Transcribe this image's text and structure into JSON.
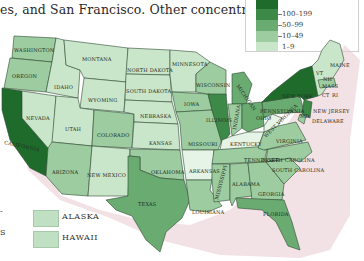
{
  "caption": "es, and San Francisco. Other concentrated",
  "legend": {
    "items": [
      {
        "label": "100–199",
        "color": "#3d8a48"
      },
      {
        "label": "50–99",
        "color": "#6aab72"
      },
      {
        "label": "10–49",
        "color": "#9ccc9f"
      },
      {
        "label": "1–9",
        "color": "#c9e6cb"
      }
    ],
    "top_color": "#1f6b2c"
  },
  "insets": [
    {
      "label": "ALASKA",
      "color": "#c9e6cb"
    },
    {
      "label": "HAWAII",
      "color": "#c9e6cb"
    }
  ],
  "left_fragments": [
    "-",
    "S"
  ],
  "states": {
    "washington": "WASHINGTON",
    "oregon": "OREGON",
    "california": "CALIFORNIA",
    "nevada": "NEVADA",
    "idaho": "IDAHO",
    "montana": "MONTANA",
    "wyoming": "WYOMING",
    "utah": "UTAH",
    "arizona": "ARIZONA",
    "colorado": "COLORADO",
    "new_mexico": "NEW MEXICO",
    "north_dakota": "NORTH DAKOTA",
    "south_dakota": "SOUTH DAKOTA",
    "nebraska": "NEBRASKA",
    "kansas": "KANSAS",
    "oklahoma": "OKLAHOMA",
    "texas": "TEXAS",
    "minnesota": "MINNESOTA",
    "iowa": "IOWA",
    "missouri": "MISSOURI",
    "arkansas": "ARKANSAS",
    "louisiana": "LOUISIANA",
    "wisconsin": "WISCONSIN",
    "illinois": "ILLINOIS",
    "michigan": "MICHIGAN",
    "indiana": "INDIANA",
    "ohio": "OHIO",
    "kentucky": "KENTUCKY",
    "tennessee": "TENNESSEE",
    "mississippi": "MISSISSIPPI",
    "alabama": "ALABAMA",
    "georgia": "GEORGIA",
    "florida": "FLORIDA",
    "south_carolina": "SOUTH CAROLINA",
    "north_carolina": "NORTH CAROLINA",
    "virginia": "VIRGINIA",
    "west_virginia": "WEST VIRGINIA",
    "pennsylvania": "PENNSYLVANIA",
    "new_york": "NEW YORK",
    "new_jersey": "NEW JERSEY",
    "delaware": "DELAWARE",
    "md": "MD",
    "vt": "VT",
    "nh": "NH",
    "maine": "MAINE",
    "mass": "MASS",
    "ct": "CT",
    "ri": "RI"
  }
}
